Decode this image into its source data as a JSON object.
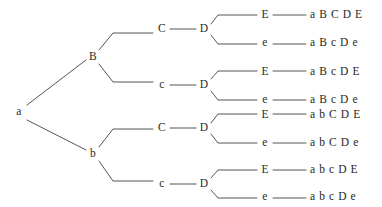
{
  "diagram": {
    "type": "binary-decision-tree",
    "line_color": "#555555",
    "text_color": "#2b2b2b",
    "background_color": "#ffffff",
    "levels": [
      "a",
      "B/b",
      "C/c",
      "D",
      "E/e",
      "outcome"
    ],
    "nodes": {
      "root": {
        "label": "a",
        "x": 19,
        "y": 112
      },
      "level1": [
        {
          "id": "n-B",
          "label": "B",
          "x": 93,
          "y": 57
        },
        {
          "id": "n-b",
          "label": "b",
          "x": 93,
          "y": 154
        }
      ],
      "level2": [
        {
          "id": "n-C1",
          "label": "C",
          "x": 162,
          "y": 29
        },
        {
          "id": "n-c1",
          "label": "c",
          "x": 162,
          "y": 85
        },
        {
          "id": "n-C2",
          "label": "C",
          "x": 162,
          "y": 128
        },
        {
          "id": "n-c2",
          "label": "c",
          "x": 162,
          "y": 184
        }
      ],
      "level3": [
        {
          "id": "n-D1",
          "label": "D",
          "x": 204,
          "y": 29
        },
        {
          "id": "n-D2",
          "label": "D",
          "x": 204,
          "y": 85
        },
        {
          "id": "n-D3",
          "label": "D",
          "x": 204,
          "y": 128
        },
        {
          "id": "n-D4",
          "label": "D",
          "x": 204,
          "y": 184
        }
      ],
      "level4": [
        {
          "id": "n-E1",
          "label": "E",
          "x": 265,
          "y": 15
        },
        {
          "id": "n-e1",
          "label": "e",
          "x": 265,
          "y": 43
        },
        {
          "id": "n-E2",
          "label": "E",
          "x": 265,
          "y": 72
        },
        {
          "id": "n-e2",
          "label": "e",
          "x": 265,
          "y": 100
        },
        {
          "id": "n-E3",
          "label": "E",
          "x": 265,
          "y": 115
        },
        {
          "id": "n-e3",
          "label": "e",
          "x": 265,
          "y": 143
        },
        {
          "id": "n-E4",
          "label": "E",
          "x": 265,
          "y": 170
        },
        {
          "id": "n-e4",
          "label": "e",
          "x": 265,
          "y": 197
        }
      ]
    },
    "leaves": [
      {
        "id": "leaf-1",
        "text": "a B C D E",
        "x": 310,
        "y": 15
      },
      {
        "id": "leaf-2",
        "text": "a B c D e",
        "x": 310,
        "y": 43
      },
      {
        "id": "leaf-3",
        "text": "a B c D E",
        "x": 310,
        "y": 72
      },
      {
        "id": "leaf-4",
        "text": "a B c D e",
        "x": 310,
        "y": 100
      },
      {
        "id": "leaf-5",
        "text": "a b C D E",
        "x": 310,
        "y": 115
      },
      {
        "id": "leaf-6",
        "text": "a b C D e",
        "x": 310,
        "y": 143
      },
      {
        "id": "leaf-7",
        "text": "a b c D E",
        "x": 310,
        "y": 170
      },
      {
        "id": "leaf-8",
        "text": "a b c D e",
        "x": 310,
        "y": 197
      }
    ],
    "edges": [
      {
        "id": "edge-root-B",
        "points": "27,105 86,60"
      },
      {
        "id": "edge-root-b",
        "points": "27,120 86,150"
      },
      {
        "id": "edge-B-C1",
        "points": "99,50 113,33 153,33"
      },
      {
        "id": "edge-B-c1",
        "points": "99,64 113,82 153,82"
      },
      {
        "id": "edge-b-C2",
        "points": "99,147 113,129 153,129"
      },
      {
        "id": "edge-b-c2",
        "points": "99,161 113,181 153,181"
      },
      {
        "id": "edge-C1-D1",
        "points": "170,29 196,29"
      },
      {
        "id": "edge-c1-D2",
        "points": "170,85 196,85"
      },
      {
        "id": "edge-C2-D3",
        "points": "170,128 196,128"
      },
      {
        "id": "edge-c2-D4",
        "points": "170,184 196,184"
      },
      {
        "id": "edge-D1-E1",
        "points": "211,24 218,15 257,15"
      },
      {
        "id": "edge-D1-e1",
        "points": "211,35 218,44 257,44"
      },
      {
        "id": "edge-D2-E2",
        "points": "211,79 218,71 257,71"
      },
      {
        "id": "edge-D2-e2",
        "points": "211,91 218,100 257,100"
      },
      {
        "id": "edge-D3-E3",
        "points": "211,123 218,114 257,114"
      },
      {
        "id": "edge-D3-e3",
        "points": "211,134 218,143 257,143"
      },
      {
        "id": "edge-D4-E4",
        "points": "211,178 218,170 257,170"
      },
      {
        "id": "edge-D4-e4",
        "points": "211,190 218,198 257,198"
      },
      {
        "id": "edge-E1-leaf1",
        "points": "273,15 306,15"
      },
      {
        "id": "edge-e1-leaf2",
        "points": "273,44 306,44"
      },
      {
        "id": "edge-E2-leaf3",
        "points": "273,71 306,71"
      },
      {
        "id": "edge-e2-leaf4",
        "points": "273,100 306,100"
      },
      {
        "id": "edge-E3-leaf5",
        "points": "273,114 306,114"
      },
      {
        "id": "edge-e3-leaf6",
        "points": "273,143 306,143"
      },
      {
        "id": "edge-E4-leaf7",
        "points": "273,170 306,170"
      },
      {
        "id": "edge-e4-leaf8",
        "points": "273,198 306,198"
      }
    ]
  }
}
